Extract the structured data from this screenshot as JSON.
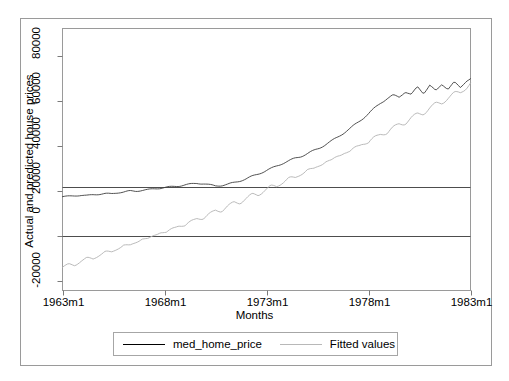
{
  "chart_data": {
    "type": "line",
    "title": "",
    "xlabel": "Months",
    "ylabel": "Actual and predicted house prices",
    "xlim": [
      1963.0,
      1983.0
    ],
    "ylim": [
      -24000,
      92000
    ],
    "xticks": [
      "1963m1",
      "1968m1",
      "1973m1",
      "1978m1",
      "1983m1"
    ],
    "xtick_values": [
      1963,
      1968,
      1973,
      1978,
      1983
    ],
    "yticks": [
      "80000",
      "60000",
      "40000",
      "20000",
      "0",
      "-20000"
    ],
    "ytick_values": [
      80000,
      60000,
      40000,
      20000,
      0,
      -20000
    ],
    "grid": false,
    "reference_lines": [
      22000,
      0
    ],
    "legend_position": "below-axes",
    "series": [
      {
        "name": "med_home_price",
        "color": "#3d3d3d",
        "x": [
          1963.0,
          1963.3,
          1963.6,
          1963.9,
          1964.2,
          1964.5,
          1964.8,
          1965.1,
          1965.4,
          1965.7,
          1966.0,
          1966.3,
          1966.6,
          1966.9,
          1967.2,
          1967.5,
          1967.8,
          1968.1,
          1968.4,
          1968.7,
          1969.0,
          1969.3,
          1969.6,
          1969.9,
          1970.2,
          1970.5,
          1970.8,
          1971.1,
          1971.4,
          1971.7,
          1972.0,
          1972.3,
          1972.6,
          1972.9,
          1973.2,
          1973.5,
          1973.8,
          1974.1,
          1974.4,
          1974.7,
          1975.0,
          1975.3,
          1975.6,
          1975.9,
          1976.2,
          1976.5,
          1976.8,
          1977.1,
          1977.4,
          1977.7,
          1978.0,
          1978.3,
          1978.6,
          1978.9,
          1979.2,
          1979.5,
          1979.8,
          1980.1,
          1980.4,
          1980.7,
          1981.0,
          1981.3,
          1981.6,
          1981.9,
          1982.2,
          1982.5,
          1982.8,
          1983.0
        ],
        "values": [
          17800,
          18000,
          18200,
          18400,
          18300,
          18700,
          18900,
          19200,
          19100,
          19600,
          19900,
          20400,
          20300,
          20700,
          21000,
          21400,
          21700,
          22100,
          22400,
          22700,
          23200,
          23600,
          24000,
          23800,
          23300,
          22900,
          23100,
          23600,
          24400,
          25200,
          26100,
          27300,
          28400,
          29500,
          30700,
          32000,
          33200,
          34300,
          35500,
          36400,
          37600,
          38900,
          40200,
          41800,
          43400,
          45200,
          47100,
          49000,
          51200,
          53400,
          55700,
          58200,
          60600,
          62500,
          64000,
          63200,
          65800,
          64400,
          67900,
          65200,
          68800,
          66100,
          69400,
          67300,
          70200,
          68000,
          71200,
          72000
        ]
      },
      {
        "name": "Fitted values",
        "color": "#b2b2b2",
        "x": [
          1963.0,
          1963.3,
          1963.6,
          1963.9,
          1964.2,
          1964.5,
          1964.8,
          1965.1,
          1965.4,
          1965.7,
          1966.0,
          1966.3,
          1966.6,
          1966.9,
          1967.2,
          1967.5,
          1967.8,
          1968.1,
          1968.4,
          1968.7,
          1969.0,
          1969.3,
          1969.6,
          1969.9,
          1970.2,
          1970.5,
          1970.8,
          1971.1,
          1971.4,
          1971.7,
          1972.0,
          1972.3,
          1972.6,
          1972.9,
          1973.2,
          1973.5,
          1973.8,
          1974.1,
          1974.4,
          1974.7,
          1975.0,
          1975.3,
          1975.6,
          1975.9,
          1976.2,
          1976.5,
          1976.8,
          1977.1,
          1977.4,
          1977.7,
          1978.0,
          1978.3,
          1978.6,
          1978.9,
          1979.2,
          1979.5,
          1979.8,
          1980.1,
          1980.4,
          1980.7,
          1981.0,
          1981.3,
          1981.6,
          1981.9,
          1982.2,
          1982.5,
          1982.8,
          1983.0
        ],
        "values": [
          -13500,
          -12200,
          -12700,
          -10800,
          -9400,
          -9900,
          -8100,
          -6600,
          -7000,
          -5200,
          -3700,
          -4100,
          -2400,
          -800,
          -1200,
          600,
          2200,
          1700,
          3600,
          5200,
          4800,
          6700,
          8400,
          8000,
          10000,
          11800,
          11400,
          13500,
          15300,
          15000,
          17000,
          18800,
          18500,
          20600,
          22400,
          22200,
          24300,
          26100,
          25900,
          28000,
          29800,
          29700,
          31800,
          33600,
          33600,
          35800,
          37600,
          37600,
          39800,
          41700,
          41700,
          44000,
          45900,
          46000,
          48300,
          50200,
          50400,
          52700,
          54600,
          54800,
          57200,
          59100,
          59400,
          61800,
          63700,
          64000,
          66400,
          68300
        ]
      }
    ]
  },
  "axes": {
    "ylabel": "Actual and predicted house prices",
    "xlabel": "Months",
    "ytick_labels": [
      "80000",
      "60000",
      "40000",
      "20000",
      "0",
      "-20000"
    ],
    "xtick_labels": [
      "1963m1",
      "1968m1",
      "1973m1",
      "1978m1",
      "1983m1"
    ]
  },
  "legend": {
    "entries": [
      {
        "label": "med_home_price",
        "color": "#3d3d3d"
      },
      {
        "label": "Fitted values",
        "color": "#b2b2b2"
      }
    ]
  },
  "colors": {
    "actual_line": "#3d3d3d",
    "fitted_line": "#b2b2b2",
    "axis": "#7a7a7a",
    "frame": "#9a9a9a",
    "reference_line": "#4d4d4d",
    "background": "#ffffff"
  }
}
